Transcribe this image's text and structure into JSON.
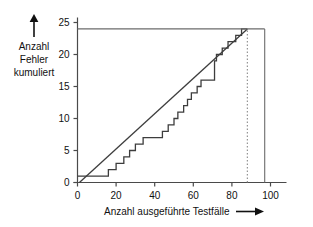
{
  "chart_data": {
    "type": "line",
    "title": "",
    "xlabel": "Anzahl ausgeführte Testfälle",
    "ylabel": "Anzahl Fehler kumuliert",
    "ylabel_lines": [
      "Anzahl",
      "Fehler",
      "kumuliert"
    ],
    "xlim": [
      0,
      103
    ],
    "ylim": [
      0,
      26
    ],
    "xticks": [
      0,
      20,
      40,
      60,
      80,
      100
    ],
    "xticklabels": [
      "0",
      "20",
      "40",
      "60",
      "80",
      "100"
    ],
    "yticks": [
      0,
      5,
      10,
      15,
      20,
      25
    ],
    "yticklabels": [
      "0",
      "5",
      "10",
      "15",
      "20",
      "25"
    ],
    "grid": false,
    "legend": null,
    "series": [
      {
        "name": "Kumulierte Fehler (Treppenfunktion)",
        "type": "step",
        "color": "#3d3d3d",
        "points": [
          [
            0,
            1
          ],
          [
            16,
            1
          ],
          [
            16,
            2
          ],
          [
            20,
            2
          ],
          [
            20,
            3
          ],
          [
            24,
            3
          ],
          [
            24,
            4
          ],
          [
            27,
            4
          ],
          [
            27,
            5
          ],
          [
            30,
            5
          ],
          [
            30,
            6
          ],
          [
            34,
            6
          ],
          [
            34,
            7
          ],
          [
            44,
            7
          ],
          [
            44,
            8
          ],
          [
            47,
            8
          ],
          [
            47,
            9
          ],
          [
            50,
            9
          ],
          [
            50,
            10
          ],
          [
            52,
            10
          ],
          [
            52,
            11
          ],
          [
            55,
            11
          ],
          [
            55,
            12
          ],
          [
            57,
            12
          ],
          [
            57,
            13
          ],
          [
            59,
            13
          ],
          [
            59,
            14
          ],
          [
            62,
            14
          ],
          [
            62,
            15
          ],
          [
            64,
            15
          ],
          [
            64,
            16
          ],
          [
            71,
            16
          ],
          [
            71,
            19
          ],
          [
            72,
            19
          ],
          [
            72,
            20
          ],
          [
            75,
            20
          ],
          [
            75,
            21
          ],
          [
            78,
            21
          ],
          [
            78,
            22
          ],
          [
            82,
            22
          ],
          [
            82,
            23
          ],
          [
            85,
            23
          ],
          [
            85,
            24
          ],
          [
            88,
            24
          ]
        ]
      },
      {
        "name": "Ideale Gerade",
        "type": "line",
        "color": "#3d3d3d",
        "points": [
          [
            1,
            0
          ],
          [
            88,
            24
          ]
        ]
      },
      {
        "name": "Sättigungsniveau",
        "type": "hline",
        "color": "#6b6b6b",
        "y": 24,
        "x_from": 0,
        "x_to": 97
      },
      {
        "name": "Testende-Markierung",
        "type": "vline-dashed",
        "color": "#8a8a8a",
        "x": 88,
        "y_from": 0,
        "y_to": 24
      },
      {
        "name": "Rechter Rahmen",
        "type": "vline",
        "color": "#6b6b6b",
        "x": 97,
        "y_from": 0,
        "y_to": 24
      }
    ],
    "annotations": [
      {
        "name": "y-axis-arrow",
        "text": "↑"
      },
      {
        "name": "x-axis-arrow",
        "text": "→"
      }
    ]
  }
}
